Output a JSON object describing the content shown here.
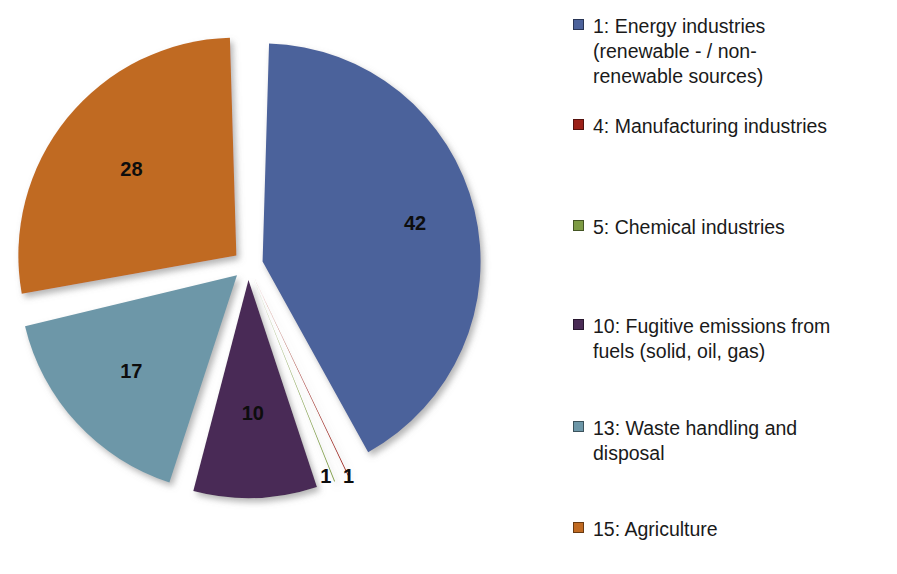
{
  "chart_data": {
    "type": "pie",
    "title": "",
    "subtitle": "",
    "xlabel": "",
    "ylabel": "",
    "grid": false,
    "legend_position": "right",
    "exploded": true,
    "start_angle_deg": 0,
    "total": 99,
    "categories": [
      "1: Energy industries (renewable - / non-renewable sources)",
      "4: Manufacturing industries",
      "5: Chemical industries",
      "10: Fugitive emissions from fuels (solid, oil, gas)",
      "13: Waste handling and disposal",
      "15: Agriculture"
    ],
    "values": [
      42,
      1,
      1,
      10,
      17,
      28
    ],
    "labels": [
      "42",
      "1",
      "1",
      "10",
      "17",
      "28"
    ],
    "colors": [
      "#4c629b",
      "#9b2018",
      "#7d9b43",
      "#4a2b56",
      "#6d97a8",
      "#c06a22"
    ],
    "slices": [
      {
        "key": "energy-industries",
        "legend_number": "1",
        "name": "Energy industries (renewable - / non-renewable sources)",
        "value": 42,
        "label": "42",
        "color": "#4c629b"
      },
      {
        "key": "manufacturing-industries",
        "legend_number": "4",
        "name": "Manufacturing industries",
        "value": 1,
        "label": "1",
        "color": "#9b2018"
      },
      {
        "key": "chemical-industries",
        "legend_number": "5",
        "name": "Chemical industries",
        "value": 1,
        "label": "1",
        "color": "#7d9b43"
      },
      {
        "key": "fugitive-emissions",
        "legend_number": "10",
        "name": "Fugitive emissions from fuels (solid, oil, gas)",
        "value": 10,
        "label": "10",
        "color": "#4a2b56"
      },
      {
        "key": "waste-handling",
        "legend_number": "13",
        "name": "Waste handling and disposal",
        "value": 17,
        "label": "17",
        "color": "#6d97a8"
      },
      {
        "key": "agriculture",
        "legend_number": "15",
        "name": "Agriculture",
        "value": 28,
        "label": "28",
        "color": "#c06a22"
      }
    ]
  },
  "pie": {
    "labels": {
      "energy": "42",
      "manufacturing": "1",
      "chemical": "1",
      "fugitive": "10",
      "waste": "17",
      "agriculture": "28"
    }
  },
  "legend": {
    "items": [
      {
        "label": "1: Energy industries\n(renewable - / non-\nrenewable sources)",
        "color": "#4c629b"
      },
      {
        "label": "4: Manufacturing industries",
        "color": "#9b2018"
      },
      {
        "label": "5: Chemical industries",
        "color": "#7d9b43"
      },
      {
        "label": "10: Fugitive emissions from\nfuels (solid, oil, gas)",
        "color": "#4a2b56"
      },
      {
        "label": "13: Waste handling and\ndisposal",
        "color": "#6d97a8"
      },
      {
        "label": "15: Agriculture",
        "color": "#c06a22"
      }
    ]
  }
}
